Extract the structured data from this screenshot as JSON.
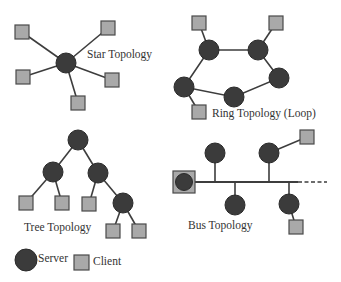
{
  "diagram": {
    "title": "",
    "colors": {
      "server": "#3b3b3b",
      "client": "#a9a9a9",
      "line": "#3d3d3d",
      "text": "#333333"
    },
    "topologies": {
      "star": {
        "label": "Star Topology",
        "server": {
          "x": 66,
          "y": 63
        },
        "clients": [
          {
            "x": 22,
            "y": 32
          },
          {
            "x": 108,
            "y": 28
          },
          {
            "x": 23,
            "y": 77
          },
          {
            "x": 112,
            "y": 80
          },
          {
            "x": 78,
            "y": 103
          }
        ]
      },
      "ring": {
        "label": "Ring Topology (Loop)",
        "servers": [
          {
            "x": 209,
            "y": 50
          },
          {
            "x": 258,
            "y": 50
          },
          {
            "x": 279,
            "y": 78
          },
          {
            "x": 234,
            "y": 97
          },
          {
            "x": 184,
            "y": 87
          }
        ],
        "clients": [
          {
            "x": 199,
            "y": 23,
            "attached_to": 0
          },
          {
            "x": 276,
            "y": 23,
            "attached_to": 1
          },
          {
            "x": 199,
            "y": 112,
            "attached_to": 4
          }
        ]
      },
      "tree": {
        "label": "Tree Topology",
        "nodes": [
          {
            "id": "root",
            "type": "server",
            "x": 78,
            "y": 140
          },
          {
            "id": "L",
            "type": "server",
            "x": 53,
            "y": 172,
            "parent": "root"
          },
          {
            "id": "R",
            "type": "server",
            "x": 98,
            "y": 173,
            "parent": "root"
          },
          {
            "id": "LL",
            "type": "client",
            "x": 26,
            "y": 203,
            "parent": "L"
          },
          {
            "id": "LR",
            "type": "client",
            "x": 62,
            "y": 203,
            "parent": "L"
          },
          {
            "id": "RL",
            "type": "client",
            "x": 89,
            "y": 204,
            "parent": "R"
          },
          {
            "id": "RR",
            "type": "server",
            "x": 123,
            "y": 203,
            "parent": "R"
          },
          {
            "id": "RRL",
            "type": "client",
            "x": 113,
            "y": 231,
            "parent": "RR"
          },
          {
            "id": "RRR",
            "type": "client",
            "x": 139,
            "y": 231,
            "parent": "RR"
          }
        ]
      },
      "bus": {
        "label": "Bus Topology",
        "backbone": {
          "y": 182,
          "x_start": 195,
          "x_end": 298,
          "dashed_end": 327
        },
        "terminal": {
          "x": 184,
          "y": 182
        },
        "servers": [
          {
            "x": 215,
            "y": 153,
            "side": "top"
          },
          {
            "x": 269,
            "y": 153,
            "side": "top"
          },
          {
            "x": 235,
            "y": 205,
            "side": "bottom"
          },
          {
            "x": 289,
            "y": 204,
            "side": "bottom"
          }
        ],
        "clients": [
          {
            "x": 307,
            "y": 137,
            "attached_to": 1
          },
          {
            "x": 296,
            "y": 227,
            "attached_to": 3
          }
        ]
      }
    },
    "legend": {
      "server_label": "Server",
      "client_label": "Client"
    }
  }
}
